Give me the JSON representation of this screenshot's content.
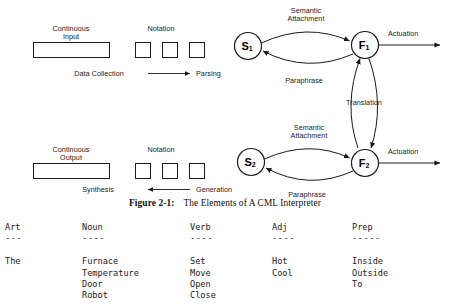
{
  "figure": {
    "caption_label": "Figure 2-1:",
    "caption_text": "The Elements of A CML Interpreter",
    "top_pipeline": {
      "box_label_line1": "Continuous",
      "box_label_line2": "Input",
      "notation_label": "Notation",
      "left_process": "Data Collection",
      "right_process": "Parsing",
      "arrow_direction": "right"
    },
    "bottom_pipeline": {
      "box_label_line1": "Continuous",
      "box_label_line2": "Output",
      "notation_label": "Notation",
      "left_process": "Synthesis",
      "right_process": "Generation",
      "arrow_direction": "left"
    },
    "nodes": [
      {
        "id": "S1",
        "letter": "S",
        "sub": "1"
      },
      {
        "id": "F1",
        "letter": "F",
        "sub": "1"
      },
      {
        "id": "S2",
        "letter": "S",
        "sub": "2"
      },
      {
        "id": "F2",
        "letter": "F",
        "sub": "2"
      }
    ],
    "edges": {
      "top_semantic_attachment_line1": "Semantic",
      "top_semantic_attachment_line2": "Attachment",
      "top_paraphrase": "Paraphrase",
      "top_actuation": "Actuation",
      "translation": "Translation",
      "bottom_semantic_attachment_line1": "Semantic",
      "bottom_semantic_attachment_line2": "Attachment",
      "bottom_paraphrase": "Paraphrase",
      "bottom_actuation": "Actuation"
    },
    "colors": {
      "stroke": "#1a1a1a",
      "text": "#1a1a1a",
      "background": "#ffffff"
    }
  },
  "lexicon": {
    "columns": [
      {
        "header": "Art",
        "rule": "---",
        "entries": [
          "The"
        ]
      },
      {
        "header": "Noun",
        "rule": "----",
        "entries": [
          "Furnace",
          "Temperature",
          "Door",
          "Robot"
        ]
      },
      {
        "header": "Verb",
        "rule": "----",
        "entries": [
          "Set",
          "Move",
          "Open",
          "Close"
        ]
      },
      {
        "header": "Adj",
        "rule": "----",
        "entries": [
          "Hot",
          "Cool"
        ]
      },
      {
        "header": "Prep",
        "rule": "-----",
        "entries": [
          "Inside",
          "Outside",
          "To"
        ]
      }
    ]
  }
}
